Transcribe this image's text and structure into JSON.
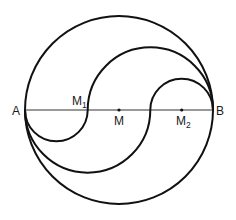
{
  "diagram": {
    "colors": {
      "stroke": "#111111",
      "background": "#ffffff"
    },
    "labels": {
      "A": "A",
      "B": "B",
      "M": "M",
      "M1_main": "M",
      "M1_sub": "1",
      "M2_main": "M",
      "M2_sub": "2"
    },
    "points": {
      "A": {
        "x": 25,
        "y": 110
      },
      "B": {
        "x": 213,
        "y": 110
      },
      "M": {
        "x": 119,
        "y": 110
      },
      "M1": {
        "x": 87.7,
        "y": 110
      },
      "M2": {
        "x": 181.7,
        "y": 110
      },
      "third_point": {
        "x": 150.3,
        "y": 110
      }
    },
    "main_circle": {
      "cx": 119,
      "cy": 110,
      "r": 94
    },
    "curves": [
      {
        "name": "s-curve-1",
        "upper_semicircle": {
          "from": "M1",
          "to": "B",
          "r": 62.7
        },
        "lower_semicircle": {
          "from": "A",
          "to": "M1",
          "r": 31.3
        }
      },
      {
        "name": "s-curve-2",
        "upper_semicircle": {
          "from": "third_point",
          "to": "B",
          "r": 31.3
        },
        "lower_semicircle": {
          "from": "A",
          "to": "third_point",
          "r": 62.7
        }
      }
    ]
  }
}
